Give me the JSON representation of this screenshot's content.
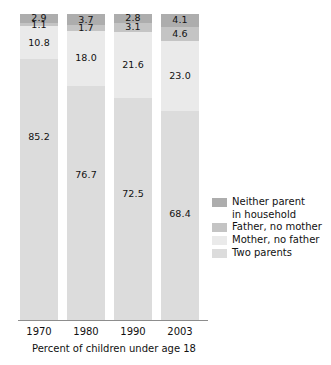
{
  "chart_data": {
    "type": "bar",
    "subtype": "stacked-bar-100",
    "title": "",
    "subtitle": "",
    "xlabel": "Percent of children under age 18",
    "ylabel": "",
    "ylim": [
      0,
      100
    ],
    "grid": false,
    "legend_position": "right",
    "categories": [
      "1970",
      "1980",
      "1990",
      "2003"
    ],
    "series": [
      {
        "name": "Neither parent in household",
        "legend_label": "Neither parent\nin household",
        "color": "#adadad",
        "values": [
          2.9,
          3.7,
          2.8,
          4.1
        ],
        "labels": [
          "2.9",
          "3.7",
          "2.8",
          "4.1"
        ]
      },
      {
        "name": "Father, no mother",
        "legend_label": "Father, no mother",
        "color": "#c4c4c4",
        "values": [
          1.1,
          1.7,
          3.1,
          4.6
        ],
        "labels": [
          "1.1",
          "1.7",
          "3.1",
          "4.6"
        ]
      },
      {
        "name": "Mother, no father",
        "legend_label": "Mother, no father",
        "color": "#eaeaea",
        "values": [
          10.8,
          18.0,
          21.6,
          23.0
        ],
        "labels": [
          "10.8",
          "18.0",
          "21.6",
          "23.0"
        ]
      },
      {
        "name": "Two parents",
        "legend_label": "Two parents",
        "color": "#dcdcdc",
        "values": [
          85.2,
          76.7,
          72.5,
          68.4
        ],
        "labels": [
          "85.2",
          "76.7",
          "72.5",
          "68.4"
        ]
      }
    ],
    "annotations": [],
    "axis_color": "#8d8d8d"
  },
  "caption": {
    "text": "Percent of children under age 18"
  },
  "x_axis": {
    "ticks": [
      "1970",
      "1980",
      "1990",
      "2003"
    ]
  },
  "legend": {
    "items": [
      {
        "label": "Neither parent\nin household",
        "color": "#adadad"
      },
      {
        "label": "Father, no mother",
        "color": "#c4c4c4"
      },
      {
        "label": "Mother, no father",
        "color": "#eaeaea"
      },
      {
        "label": "Two parents",
        "color": "#dcdcdc"
      }
    ]
  },
  "bars": [
    {
      "category": "1970",
      "segments": [
        {
          "label": "2.9",
          "value": 2.9,
          "series": "Neither parent in household"
        },
        {
          "label": "1.1",
          "value": 1.1,
          "series": "Father, no mother"
        },
        {
          "label": "10.8",
          "value": 10.8,
          "series": "Mother, no father"
        },
        {
          "label": "85.2",
          "value": 85.2,
          "series": "Two parents"
        }
      ]
    },
    {
      "category": "1980",
      "segments": [
        {
          "label": "3.7",
          "value": 3.7,
          "series": "Neither parent in household"
        },
        {
          "label": "1.7",
          "value": 1.7,
          "series": "Father, no mother"
        },
        {
          "label": "18.0",
          "value": 18.0,
          "series": "Mother, no father"
        },
        {
          "label": "76.7",
          "value": 76.7,
          "series": "Two parents"
        }
      ]
    },
    {
      "category": "1990",
      "segments": [
        {
          "label": "2.8",
          "value": 2.8,
          "series": "Neither parent in household"
        },
        {
          "label": "3.1",
          "value": 3.1,
          "series": "Father, no mother"
        },
        {
          "label": "21.6",
          "value": 21.6,
          "series": "Mother, no father"
        },
        {
          "label": "72.5",
          "value": 72.5,
          "series": "Two parents"
        }
      ]
    },
    {
      "category": "2003",
      "segments": [
        {
          "label": "4.1",
          "value": 4.1,
          "series": "Neither parent in household"
        },
        {
          "label": "4.6",
          "value": 4.6,
          "series": "Father, no mother"
        },
        {
          "label": "23.0",
          "value": 23.0,
          "series": "Mother, no father"
        },
        {
          "label": "68.4",
          "value": 68.4,
          "series": "Two parents"
        }
      ]
    }
  ]
}
